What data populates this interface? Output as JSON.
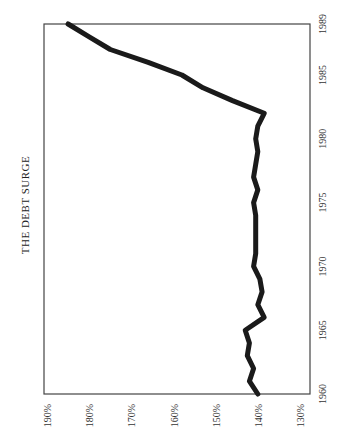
{
  "chart_data": {
    "type": "line",
    "title": "THE DEBT SURGE",
    "orientation": "rotated-90-clockwise",
    "xlabel": "",
    "ylabel": "",
    "x_ticks": [
      "1960",
      "1965",
      "1970",
      "1975",
      "1980",
      "1985",
      "1989"
    ],
    "y_ticks": [
      "190%",
      "180%",
      "170%",
      "160%",
      "150%",
      "140%",
      "130%"
    ],
    "xlim": [
      1960,
      1989
    ],
    "ylim": [
      130,
      190
    ],
    "grid": false,
    "legend": null,
    "series": [
      {
        "name": "Debt",
        "x": [
          1960,
          1961,
          1962,
          1963,
          1964,
          1965,
          1966,
          1967,
          1968,
          1969,
          1970,
          1971,
          1972,
          1973,
          1974,
          1975,
          1976,
          1977,
          1978,
          1979,
          1980,
          1981,
          1982,
          1983,
          1984,
          1985,
          1986,
          1987,
          1988,
          1989
        ],
        "values": [
          140,
          142,
          141,
          142.5,
          142,
          143,
          138.5,
          140,
          139,
          139.5,
          141,
          140.5,
          140.5,
          140.5,
          140.5,
          141,
          140,
          141,
          140.5,
          140,
          140.5,
          140,
          138.5,
          146,
          153,
          158,
          166,
          175,
          180,
          185
        ]
      }
    ]
  }
}
